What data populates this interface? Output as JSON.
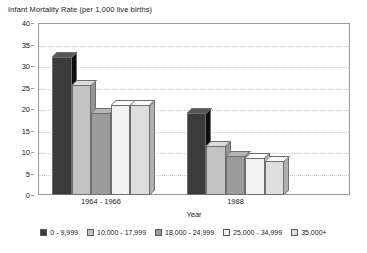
{
  "chart_data": {
    "type": "bar",
    "title": "Infant Mortality Rate (per 1,000 live births)",
    "xlabel": "Year",
    "ylabel": "",
    "ylim": [
      0,
      40
    ],
    "yticks": [
      0,
      5,
      10,
      15,
      20,
      25,
      30,
      35,
      40
    ],
    "ytick_labels": [
      "0",
      "5",
      "10",
      "15",
      "20",
      "25",
      "30",
      "35",
      "40"
    ],
    "grid": true,
    "legend_position": "bottom",
    "categories": [
      "1964 - 1966",
      "1988"
    ],
    "series": [
      {
        "name": "0 - 9,999",
        "values": [
          32,
          19
        ],
        "color": "#3b3b3b"
      },
      {
        "name": "10,000 - 17,999",
        "values": [
          25.5,
          11.5
        ],
        "color": "#c2c2c2"
      },
      {
        "name": "18,000 - 24,999",
        "values": [
          19,
          9
        ],
        "color": "#9b9b9b"
      },
      {
        "name": "25,000 - 34,999",
        "values": [
          21,
          8.5
        ],
        "color": "#f2f2f2"
      },
      {
        "name": "35,000+",
        "values": [
          21,
          8
        ],
        "color": "#dedede"
      }
    ]
  },
  "legend": {
    "items": [
      {
        "label": "0 - 9,999"
      },
      {
        "label": "10,000 - 17,999"
      },
      {
        "label": "18,000 - 24,999"
      },
      {
        "label": "25,000 - 34,999"
      },
      {
        "label": "35,000+"
      }
    ]
  }
}
